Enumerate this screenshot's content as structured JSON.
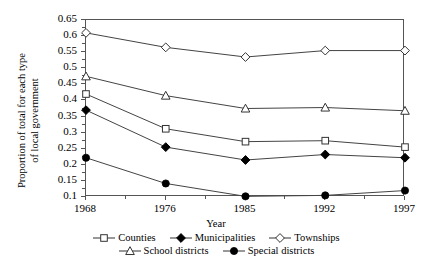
{
  "chart_data": {
    "type": "line",
    "title": "",
    "xlabel": "Year",
    "ylabel": "Proportion of total for each type\nof local government",
    "categories": [
      "1968",
      "1976",
      "1985",
      "1992",
      "1997"
    ],
    "x": [
      1968,
      1976,
      1985,
      1992,
      1997
    ],
    "xlim": [
      1968,
      1997
    ],
    "ylim": [
      0.1,
      0.65
    ],
    "yticks": [
      "0.65",
      "0.6",
      "0.55",
      "0.5",
      "0.45",
      "0.4",
      "0.35",
      "0.3",
      "0.25",
      "0.2",
      "0.15",
      "0.1"
    ],
    "ytick_values": [
      0.65,
      0.6,
      0.55,
      0.5,
      0.45,
      0.4,
      0.35,
      0.3,
      0.25,
      0.2,
      0.15,
      0.1
    ],
    "grid": false,
    "legend_position": "below",
    "series": [
      {
        "name": "Counties",
        "marker": "open-square",
        "values": [
          0.42,
          0.312,
          0.272,
          0.275,
          0.255
        ]
      },
      {
        "name": "Municipalities",
        "marker": "filled-diamond",
        "values": [
          0.37,
          0.255,
          0.215,
          0.232,
          0.222
        ]
      },
      {
        "name": "Townships",
        "marker": "open-diamond",
        "values": [
          0.61,
          0.565,
          0.535,
          0.555,
          0.555
        ]
      },
      {
        "name": "School districts",
        "marker": "open-triangle",
        "values": [
          0.475,
          0.415,
          0.375,
          0.378,
          0.368
        ]
      },
      {
        "name": "Special districts",
        "marker": "filled-circle",
        "values": [
          0.222,
          0.142,
          0.102,
          0.105,
          0.12
        ]
      }
    ]
  },
  "legend": {
    "row1": [
      "Counties",
      "Municipalities",
      "Townships"
    ],
    "row2": [
      "School districts",
      "Special districts"
    ]
  },
  "colors": {
    "axis": "#555555",
    "line": "#444444",
    "marker_fill": "#000000",
    "marker_open": "#ffffff",
    "background": "#ffffff"
  }
}
